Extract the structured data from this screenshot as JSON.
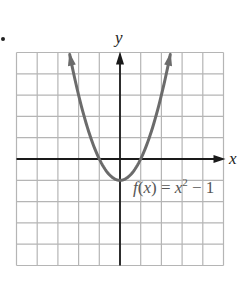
{
  "chart_data": {
    "type": "line",
    "title": "",
    "xlabel": "x",
    "ylabel": "y",
    "function": "f(x) = x^2 - 1",
    "function_label": {
      "name": "f",
      "arg": "x",
      "eq": "=",
      "base": "x",
      "exp": "2",
      "rest": "− 1"
    },
    "xlim": [
      -5,
      5
    ],
    "ylim": [
      -5,
      5
    ],
    "grid": true,
    "grid_step": 1,
    "vertex": [
      0,
      -1
    ],
    "x_intercepts": [
      -1,
      1
    ],
    "y_intercept": -1,
    "series": [
      {
        "name": "f(x) = x^2 - 1",
        "x": [
          -2.45,
          -2,
          -1.5,
          -1,
          -0.5,
          0,
          0.5,
          1,
          1.5,
          2,
          2.45
        ],
        "y": [
          5.0,
          3,
          1.25,
          0,
          -0.75,
          -1,
          -0.75,
          0,
          1.25,
          3,
          5.0
        ],
        "color": "#6b6b6b"
      }
    ],
    "axis_color": "#1a1a1a",
    "grid_color": "#b5b5b5"
  },
  "labels": {
    "y_axis": "y",
    "x_axis": "x"
  }
}
